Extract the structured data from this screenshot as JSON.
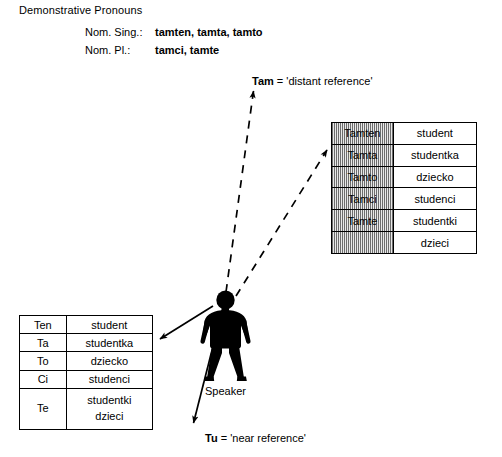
{
  "header": {
    "title": "Demonstrative Pronouns",
    "rows": [
      {
        "label": "Nom. Sing.:",
        "value": "tamten, tamta, tamto"
      },
      {
        "label": "Nom. Pl.:",
        "value": "tamci, tamte"
      }
    ]
  },
  "near_table": {
    "caption": "near reference forms",
    "rows": [
      {
        "pronoun": "Ten",
        "noun": "student"
      },
      {
        "pronoun": "Ta",
        "noun": "studentka"
      },
      {
        "pronoun": "To",
        "noun": "dziecko"
      },
      {
        "pronoun": "Ci",
        "noun": "studenci"
      },
      {
        "pronoun": "Te",
        "noun": "studentki",
        "noun2": "dzieci"
      }
    ]
  },
  "far_table": {
    "caption": "distant reference forms",
    "rows": [
      {
        "pronoun": "Tamten",
        "noun": "student"
      },
      {
        "pronoun": "Tamta",
        "noun": "studentka"
      },
      {
        "pronoun": "Tamto",
        "noun": "dziecko"
      },
      {
        "pronoun": "Tamci",
        "noun": "studenci"
      },
      {
        "pronoun": "Tamte",
        "noun": "studentki"
      },
      {
        "pronoun": "",
        "noun": "dzieci"
      }
    ]
  },
  "annotations": {
    "distant": {
      "term": "Tam",
      "rest": " = 'distant reference'"
    },
    "near": {
      "term": "Tu",
      "rest": " = 'near reference'"
    },
    "speaker": "Speaker"
  },
  "colors": {
    "ink": "#000000",
    "paper": "#ffffff",
    "hatch_dark": "#6d6d6d",
    "hatch_light": "#e8e8e8"
  }
}
